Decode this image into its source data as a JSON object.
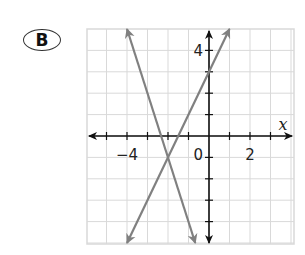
{
  "badge": {
    "label": "B"
  },
  "chart_data": {
    "type": "line",
    "title": "",
    "xlabel": "x",
    "ylabel": "",
    "xlim": [
      -6,
      4
    ],
    "ylim": [
      -5,
      5
    ],
    "grid": true,
    "x_tick_labels": [
      {
        "value": -4,
        "text": "−4"
      },
      {
        "value": 0,
        "text": "0"
      },
      {
        "value": 2,
        "text": "2"
      }
    ],
    "y_tick_labels": [
      {
        "value": 4,
        "text": "4"
      }
    ],
    "series": [
      {
        "name": "line-1",
        "equation": "y = 2x + 3",
        "slope": 2,
        "intercept": 3,
        "x": [
          -4,
          1
        ],
        "y": [
          -5,
          5
        ],
        "color": "#808080",
        "arrows": "both"
      },
      {
        "name": "line-2",
        "equation": "y = -3x - 7",
        "slope": -3,
        "intercept": -7,
        "x": [
          -4,
          -0.67
        ],
        "y": [
          5,
          -5
        ],
        "color": "#808080",
        "arrows": "both"
      }
    ],
    "intersection": {
      "x": -2,
      "y": -1
    },
    "colors": {
      "grid": "#d9d9d9",
      "axes": "#111111",
      "lines": "#808080"
    }
  }
}
